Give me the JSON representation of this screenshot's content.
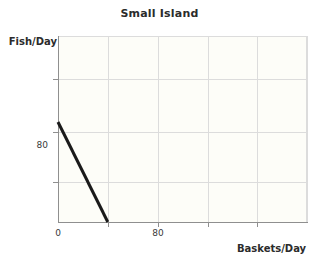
{
  "chart_data": {
    "type": "line",
    "title": "Small Island",
    "xlabel": "Baskets/Day",
    "ylabel": "Fish/Day",
    "xlim": [
      0,
      400
    ],
    "ylim": [
      0,
      148
    ],
    "grid": true,
    "legend": null,
    "x_tick_labels": [
      "0",
      "80"
    ],
    "x_tick_values": [
      0,
      80
    ],
    "y_tick_labels": [
      "80"
    ],
    "y_tick_values": [
      80
    ],
    "x_gridline_values": [
      0,
      80,
      160,
      240,
      320,
      400
    ],
    "y_gridline_values": [
      34,
      74,
      114,
      148
    ],
    "series": [
      {
        "name": "production-possibilities-frontier",
        "color": "#1a1a1a",
        "linewidth": 3,
        "x": [
          0,
          80
        ],
        "y": [
          80,
          0
        ]
      }
    ],
    "annotations": []
  },
  "colors": {
    "line": "#1a1a1a",
    "grid": "#dcdcdc",
    "axis": "#8f8f8f",
    "text": "#2b2b2b",
    "tick_text": "#3a3a3a",
    "plot_background": "#fdfdf8",
    "figure_background": "#ffffff"
  }
}
